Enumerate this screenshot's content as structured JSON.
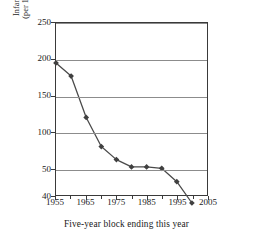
{
  "chart_data": {
    "type": "line",
    "title": "",
    "xlabel": "Five-year block ending this year",
    "ylabel_line1": "Infant mortality rate",
    "ylabel_line2": "(per 1,000 live births)",
    "x": [
      1955,
      1960,
      1965,
      1970,
      1975,
      1980,
      1985,
      1990,
      1995,
      2000
    ],
    "values": [
      195,
      177,
      120,
      80,
      62,
      52,
      52,
      50,
      45,
      37
    ],
    "series": [
      {
        "name": "Infant mortality rate",
        "values": [
          195,
          177,
          120,
          80,
          62,
          52,
          52,
          50,
          45,
          37
        ]
      }
    ],
    "points": [
      {
        "x": 1955,
        "y": 195
      },
      {
        "x": 1960,
        "y": 177
      },
      {
        "x": 1965,
        "y": 120
      },
      {
        "x": 1970,
        "y": 80
      },
      {
        "x": 1975,
        "y": 62
      },
      {
        "x": 1980,
        "y": 52
      },
      {
        "x": 1985,
        "y": 52
      },
      {
        "x": 1990,
        "y": 50
      },
      {
        "x": 1995,
        "y": 45
      },
      {
        "x": 2000,
        "y": 37
      }
    ],
    "ytick_labels": [
      "250",
      "200",
      "150",
      "100",
      "50",
      "40"
    ],
    "ytick_values": [
      250,
      200,
      150,
      100,
      50,
      40
    ],
    "xtick_labels": [
      "1955",
      "1965",
      "1975",
      "1985",
      "1995",
      "2005"
    ],
    "xtick_values": [
      1955,
      1965,
      1975,
      1985,
      1995,
      2005
    ],
    "xlim": [
      1955,
      2005
    ],
    "ylim": [
      40,
      250
    ],
    "grid": "horizontal",
    "legend": "none",
    "marker": "diamond",
    "line_color": "#4a4a4a",
    "marker_color": "#404040",
    "grid_color": "#8c8c8c",
    "frame_color": "#3a3a3a"
  }
}
